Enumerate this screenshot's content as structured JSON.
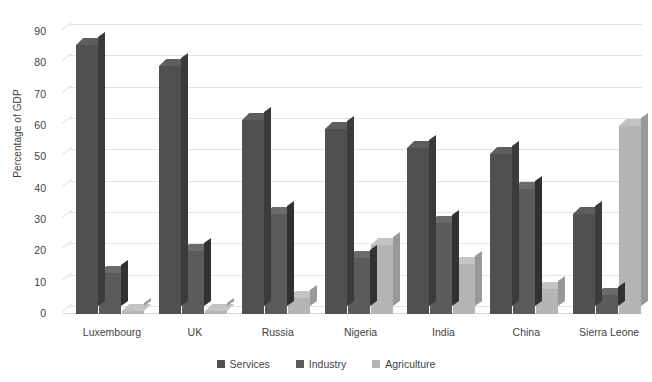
{
  "chart_data": {
    "type": "bar",
    "title": "",
    "xlabel": "",
    "ylabel": "Percentage of GDP",
    "ylim": [
      0,
      90
    ],
    "yticks": [
      0,
      10,
      20,
      30,
      40,
      50,
      60,
      70,
      80,
      90
    ],
    "grid": true,
    "legend_position": "bottom",
    "categories": [
      "Luxembourg",
      "UK",
      "Russia",
      "Nigeria",
      "India",
      "China",
      "Sierra Leone"
    ],
    "series": [
      {
        "name": "Services",
        "color": "#4f5052",
        "values": [
          86,
          79,
          62,
          59,
          53,
          51,
          32
        ]
      },
      {
        "name": "Industry",
        "color": "#5a5b5d",
        "values": [
          13,
          20,
          32,
          18,
          29,
          40,
          6
        ]
      },
      {
        "name": "Agriculture",
        "color": "#b4b5b6",
        "values": [
          1,
          1,
          5,
          22,
          16,
          8,
          60
        ]
      }
    ]
  },
  "axis": {
    "y_title": "Percentage of GDP",
    "ticks": [
      "90",
      "80",
      "70",
      "60",
      "50",
      "40",
      "30",
      "20",
      "10",
      "0"
    ]
  },
  "categories": {
    "c0": "Luxembourg",
    "c1": "UK",
    "c2": "Russia",
    "c3": "Nigeria",
    "c4": "India",
    "c5": "China",
    "c6": "Sierra Leone"
  },
  "legend": {
    "items": [
      {
        "label": "Services",
        "color": "#4f5052"
      },
      {
        "label": "Industry",
        "color": "#5a5b5d"
      },
      {
        "label": "Agriculture",
        "color": "#b4b5b6"
      }
    ]
  }
}
